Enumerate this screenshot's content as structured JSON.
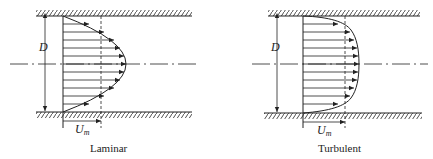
{
  "diagrams": [
    {
      "id": "laminar",
      "caption": "Laminar",
      "diameter_label": "D",
      "velocity_label": "U",
      "velocity_subscript": "m",
      "profile_shape": "parabolic",
      "arrow_count": 11
    },
    {
      "id": "turbulent",
      "caption": "Turbulent",
      "diameter_label": "D",
      "velocity_label": "U",
      "velocity_subscript": "m",
      "profile_shape": "flattened",
      "arrow_count": 11
    }
  ],
  "colors": {
    "ink": "#222222",
    "background": "#ffffff"
  }
}
